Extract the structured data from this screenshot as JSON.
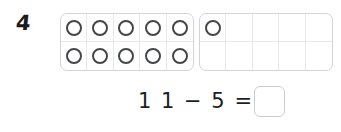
{
  "problem": {
    "number": "4",
    "equation": {
      "expression": "1 1 − 5 =",
      "minuend": "11",
      "operator": "−",
      "subtrahend": "5",
      "equals": "=",
      "answer_value": ""
    }
  },
  "ten_frames": [
    {
      "name": "left-ten-frame",
      "columns": 5,
      "rows": 2,
      "filled_count": 10,
      "cells": [
        "counter",
        "counter",
        "counter",
        "counter",
        "counter",
        "counter",
        "counter",
        "counter",
        "counter",
        "counter"
      ]
    },
    {
      "name": "right-ten-frame",
      "columns": 5,
      "rows": 2,
      "filled_count": 1,
      "cells": [
        "counter",
        "empty",
        "empty",
        "empty",
        "empty",
        "empty",
        "empty",
        "empty",
        "empty",
        "empty"
      ]
    }
  ],
  "colors": {
    "background": "#ffffff",
    "text": "#1a1a1a",
    "frame_border": "#d2d4d8",
    "cell_divider": "#e6e8ea",
    "counter_stroke": "#454648",
    "answer_box_border": "#c9ccd1"
  }
}
